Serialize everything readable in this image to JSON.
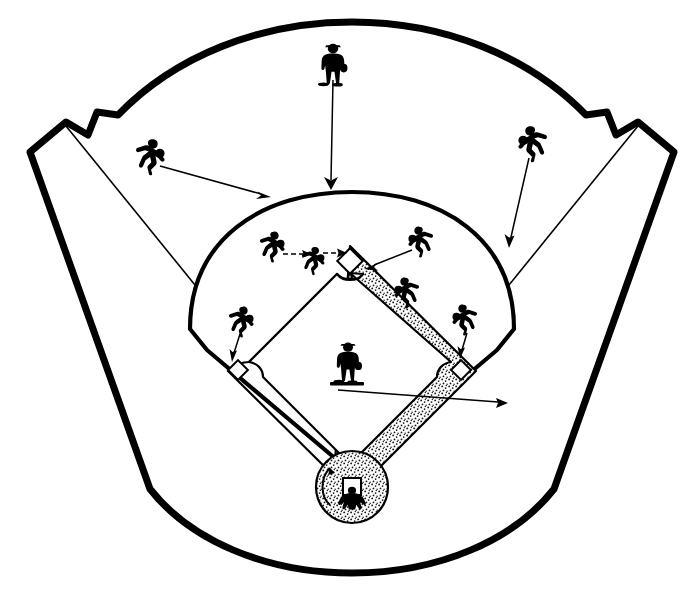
{
  "diagram": {
    "title": "Baseball Field Defensive Positions",
    "type": "baseball-field-diagram",
    "width": 696,
    "height": 606,
    "colors": {
      "line": "#000000",
      "background": "#ffffff",
      "dirt_fill": "#000000",
      "base_fill": "#ffffff"
    }
  },
  "field": {
    "outfield_wall_label": "outfield-wall",
    "foul_line_left_label": "left-foul-line",
    "foul_line_right_label": "right-foul-line",
    "infield_arc_label": "infield-grass-arc",
    "basepath_label": "base-path-diamond",
    "home_circle_label": "home-plate-circle",
    "backstop_label": "backstop"
  },
  "bases": [
    {
      "id": "home-plate",
      "name": "Home Plate",
      "cx": 352,
      "cy": 487,
      "size": 16
    },
    {
      "id": "first-base",
      "name": "First Base",
      "cx": 461,
      "cy": 370,
      "size": 15
    },
    {
      "id": "second-base",
      "name": "Second Base",
      "cx": 350,
      "cy": 261,
      "size": 17
    },
    {
      "id": "third-base",
      "name": "Third Base",
      "cx": 238,
      "cy": 370,
      "size": 15
    }
  ],
  "players": [
    {
      "id": "center-fielder",
      "name": "Center Fielder",
      "x": 333,
      "y": 64,
      "facing": "front",
      "scale": 1.45
    },
    {
      "id": "left-fielder",
      "name": "Left Fielder",
      "x": 150,
      "y": 156,
      "facing": "right",
      "scale": 1.35
    },
    {
      "id": "right-fielder",
      "name": "Right Fielder",
      "x": 533,
      "y": 143,
      "facing": "left",
      "scale": 1.35
    },
    {
      "id": "shortstop",
      "name": "Shortstop",
      "x": 272,
      "y": 246,
      "facing": "right",
      "scale": 1.15
    },
    {
      "id": "shortstop-moved",
      "name": "Shortstop Moving To Base",
      "x": 312,
      "y": 259,
      "facing": "right",
      "scale": 1.05
    },
    {
      "id": "second-baseman",
      "name": "Second Baseman",
      "x": 421,
      "y": 241,
      "facing": "left",
      "scale": 1.15
    },
    {
      "id": "second-baseman-deep",
      "name": "Second Baseman Deep",
      "x": 407,
      "y": 292,
      "facing": "left",
      "scale": 1.15
    },
    {
      "id": "third-baseman",
      "name": "Third Baseman",
      "x": 241,
      "y": 321,
      "facing": "right",
      "scale": 1.15
    },
    {
      "id": "first-baseman",
      "name": "First Baseman",
      "x": 465,
      "y": 319,
      "facing": "left",
      "scale": 1.15
    },
    {
      "id": "pitcher",
      "name": "Pitcher",
      "x": 348,
      "y": 360,
      "facing": "front",
      "scale": 1.45
    },
    {
      "id": "catcher",
      "name": "Catcher",
      "x": 352,
      "y": 500,
      "facing": "front",
      "scale": 1.2
    }
  ],
  "arrows": [
    {
      "id": "center-fielder-arrow",
      "from_player": "center-fielder",
      "x1": 333,
      "y1": 80,
      "x2": 331,
      "y2": 188,
      "style": "solid"
    },
    {
      "id": "left-fielder-arrow",
      "from_player": "left-fielder",
      "x1": 160,
      "y1": 166,
      "x2": 268,
      "y2": 197,
      "style": "solid"
    },
    {
      "id": "right-fielder-arrow",
      "from_player": "right-fielder",
      "x1": 529,
      "y1": 158,
      "x2": 509,
      "y2": 245,
      "style": "solid"
    },
    {
      "id": "shortstop-arrow",
      "from_player": "shortstop",
      "x1": 283,
      "y1": 254,
      "x2": 310,
      "y2": 254,
      "style": "dashed"
    },
    {
      "id": "shortstop-to-base-arrow",
      "from_player": "shortstop-moved",
      "x1": 322,
      "y1": 254,
      "x2": 345,
      "y2": 253,
      "style": "dashed"
    },
    {
      "id": "second-baseman-arrow",
      "from_player": "second-baseman",
      "x1": 412,
      "y1": 250,
      "x2": 366,
      "y2": 268,
      "style": "solid"
    },
    {
      "id": "third-baseman-arrow",
      "from_player": "third-baseman",
      "x1": 239,
      "y1": 334,
      "x2": 233,
      "y2": 361,
      "style": "solid"
    },
    {
      "id": "first-baseman-arrow",
      "from_player": "first-baseman",
      "x1": 466,
      "y1": 333,
      "x2": 461,
      "y2": 358,
      "style": "solid"
    },
    {
      "id": "pitcher-arrow",
      "from_player": "pitcher",
      "x1": 340,
      "y1": 388,
      "x2": 506,
      "y2": 403,
      "style": "solid"
    }
  ],
  "pitchers_rubber": {
    "id": "pitchers-rubber",
    "name": "Pitchers Rubber",
    "cx": 345,
    "cy": 384
  }
}
